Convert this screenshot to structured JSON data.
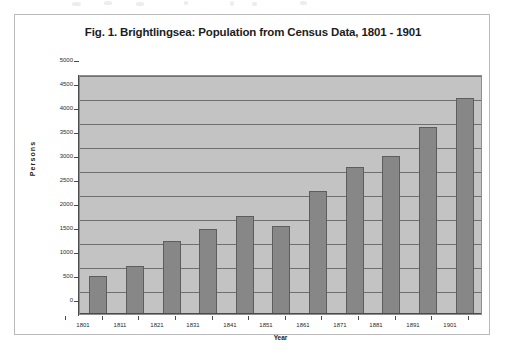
{
  "figure": {
    "title": "Fig. 1. Brightlingsea: Population from Census Data, 1801 - 1901"
  },
  "chart_data": {
    "type": "bar",
    "title": "Fig. 1. Brightlingsea: Population from Census Data, 1801 - 1901",
    "xlabel": "Year",
    "ylabel": "Persons",
    "categories": [
      "1801",
      "1811",
      "1821",
      "1831",
      "1841",
      "1851",
      "1861",
      "1871",
      "1881",
      "1891",
      "1901"
    ],
    "values": [
      800,
      1010,
      1520,
      1780,
      2040,
      1840,
      2560,
      3060,
      3300,
      3900,
      4490
    ],
    "ylim": [
      0,
      5000
    ],
    "ytick_labels": [
      "5000",
      "4500",
      "4000",
      "3500",
      "3000",
      "2500",
      "2000",
      "1500",
      "1000",
      "500",
      "0"
    ],
    "ytick_values": [
      5000,
      4500,
      4000,
      3500,
      3000,
      2500,
      2000,
      1500,
      1000,
      500,
      0
    ],
    "ytick_step": 500,
    "grid": true,
    "legend": false,
    "legend_position": "none",
    "series": [
      {
        "name": "Persons",
        "values": [
          800,
          1010,
          1520,
          1780,
          2040,
          1840,
          2560,
          3060,
          3300,
          3900,
          4490
        ],
        "color": "#878787"
      }
    ],
    "colors": {
      "bar_fill": "#878787",
      "bar_border": "#5d5d5d",
      "plot_background": "#c3c3c3",
      "gridline": "#6f6f6f",
      "axis": "#4a4a4a",
      "page_background": "#ffffff",
      "frame_border": "#b9b9b9",
      "text": "#1d1d1d"
    }
  }
}
